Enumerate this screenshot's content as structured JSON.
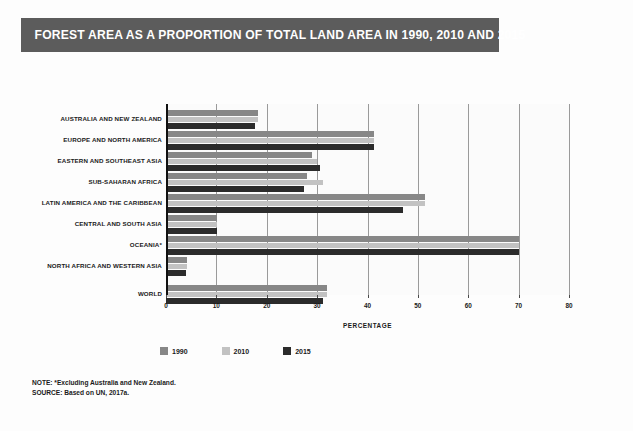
{
  "title": "FOREST AREA AS A PROPORTION OF TOTAL LAND AREA IN 1990, 2010 AND 2015",
  "colors": {
    "title_bar": "#5c5c5c",
    "series_1990": "#878787",
    "series_2010": "#c2c2c2",
    "series_2015": "#2b2b2b",
    "grid": "#9a9a9a",
    "axis": "#111111",
    "page_background": "#fdfdfd"
  },
  "legend": {
    "position": "bottom-left",
    "items": [
      {
        "label": "1990",
        "color": "#878787"
      },
      {
        "label": "2010",
        "color": "#c2c2c2"
      },
      {
        "label": "2015",
        "color": "#2b2b2b"
      }
    ]
  },
  "footnotes": [
    "NOTE: *Excluding Australia and New Zealand.",
    "SOURCE: Based on UN, 2017a."
  ],
  "chart_data": {
    "type": "bar",
    "orientation": "horizontal",
    "title": "FOREST AREA AS A PROPORTION OF TOTAL LAND AREA IN 1990, 2010 AND 2015",
    "xlabel": "PERCENTAGE",
    "ylabel": "",
    "xlim": [
      0,
      80
    ],
    "xticks": [
      0,
      10,
      20,
      30,
      40,
      50,
      60,
      70,
      80
    ],
    "xtick_labels": [
      "0",
      "10",
      "20",
      "30",
      "40",
      "50",
      "60",
      "70",
      "80"
    ],
    "grid": true,
    "grid_axis": "x",
    "categories": [
      "AUSTRALIA AND NEW ZEALAND",
      "EUROPE AND NORTH AMERICA",
      "EASTERN AND SOUTHEAST ASIA",
      "SUB-SAHARAN AFRICA",
      "LATIN AMERICA AND THE CARIBBEAN",
      "CENTRAL AND SOUTH ASIA",
      "OCEANIA*",
      "NORTH AFRICA AND WESTERN ASIA",
      "WORLD"
    ],
    "series": [
      {
        "name": "1990",
        "color": "#878787",
        "values": [
          18.3,
          41.2,
          29.0,
          28.0,
          51.5,
          10.1,
          70.0,
          4.2,
          32.0
        ]
      },
      {
        "name": "2010",
        "color": "#c2c2c2",
        "values": [
          18.3,
          41.2,
          30.0,
          31.2,
          51.5,
          10.1,
          70.0,
          4.2,
          32.0
        ]
      },
      {
        "name": "2015",
        "color": "#2b2b2b",
        "values": [
          17.7,
          41.2,
          30.5,
          27.3,
          47.0,
          10.1,
          70.0,
          4.0,
          31.2
        ]
      }
    ]
  }
}
